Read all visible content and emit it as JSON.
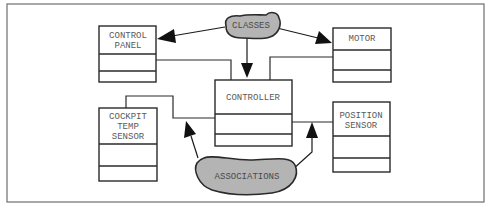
{
  "diagram": {
    "type": "uml-class-diagram-annotated",
    "classes": [
      {
        "id": "control-panel",
        "name_lines": [
          "CONTROL",
          "PANEL"
        ]
      },
      {
        "id": "motor",
        "name_lines": [
          "MOTOR"
        ]
      },
      {
        "id": "controller",
        "name_lines": [
          "CONTROLLER"
        ]
      },
      {
        "id": "cockpit-temp-sensor",
        "name_lines": [
          "COCKPIT",
          "TEMP",
          "SENSOR"
        ]
      },
      {
        "id": "position-sensor",
        "name_lines": [
          "POSITION",
          "SENSOR"
        ]
      }
    ],
    "callouts": {
      "classes": {
        "label": "CLASSES",
        "points_to": [
          "control-panel",
          "controller",
          "motor"
        ]
      },
      "associations": {
        "label": "ASSOCIATIONS",
        "points_to": [
          "controller-cockpit-association",
          "controller-position-association"
        ]
      }
    },
    "associations": [
      {
        "from": "control-panel",
        "to": "controller"
      },
      {
        "from": "motor",
        "to": "controller"
      },
      {
        "from": "cockpit-temp-sensor",
        "to": "controller"
      },
      {
        "from": "position-sensor",
        "to": "controller"
      }
    ],
    "colors": {
      "box_stroke": "#2a2a2a",
      "blob_fill": "#b4b4b4",
      "text": "#5a5a5a",
      "frame": "#6e6e6e"
    }
  }
}
